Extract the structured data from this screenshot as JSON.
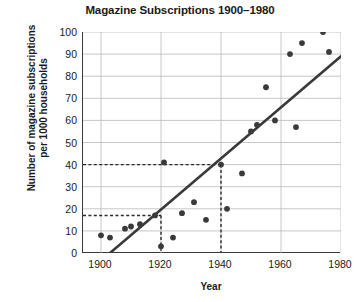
{
  "chart_data": {
    "type": "scatter",
    "title": "Magazine Subscriptions 1900–1980",
    "xlabel": "Year",
    "ylabel": "Number of magazine subscriptions per 1000 households",
    "ylabel_line1": "Number of magazine subscriptions",
    "ylabel_line2": "per 1000 households",
    "xlim": [
      1894,
      1980
    ],
    "ylim": [
      0,
      100
    ],
    "xticks": [
      1900,
      1920,
      1940,
      1960,
      1980
    ],
    "yticks": [
      0,
      10,
      20,
      30,
      40,
      50,
      60,
      70,
      80,
      90,
      100
    ],
    "grid": true,
    "legend": null,
    "marker_color": "#3a3a3a",
    "trendline_color": "#3a3a3a",
    "grid_color": "#b9b9b9",
    "axis_color": "#3a3a3a",
    "points": [
      {
        "x": 1900,
        "y": 8
      },
      {
        "x": 1903,
        "y": 7
      },
      {
        "x": 1908,
        "y": 11
      },
      {
        "x": 1910,
        "y": 12
      },
      {
        "x": 1913,
        "y": 13
      },
      {
        "x": 1918,
        "y": 17
      },
      {
        "x": 1920,
        "y": 3
      },
      {
        "x": 1921,
        "y": 41
      },
      {
        "x": 1924,
        "y": 7
      },
      {
        "x": 1927,
        "y": 18
      },
      {
        "x": 1931,
        "y": 23
      },
      {
        "x": 1935,
        "y": 15
      },
      {
        "x": 1940,
        "y": 40
      },
      {
        "x": 1942,
        "y": 20
      },
      {
        "x": 1947,
        "y": 36
      },
      {
        "x": 1950,
        "y": 55
      },
      {
        "x": 1952,
        "y": 58
      },
      {
        "x": 1955,
        "y": 75
      },
      {
        "x": 1958,
        "y": 60
      },
      {
        "x": 1963,
        "y": 90
      },
      {
        "x": 1965,
        "y": 57
      },
      {
        "x": 1967,
        "y": 95
      },
      {
        "x": 1974,
        "y": 100
      },
      {
        "x": 1976,
        "y": 91
      }
    ],
    "trendline": {
      "x0": 1903,
      "y0": 0,
      "x1": 1980,
      "y1": 89
    },
    "guides": [
      {
        "label": "40 at 1940",
        "y": 40,
        "x": 1940
      },
      {
        "label": "17 at 1920",
        "y": 17,
        "x": 1920
      }
    ]
  }
}
